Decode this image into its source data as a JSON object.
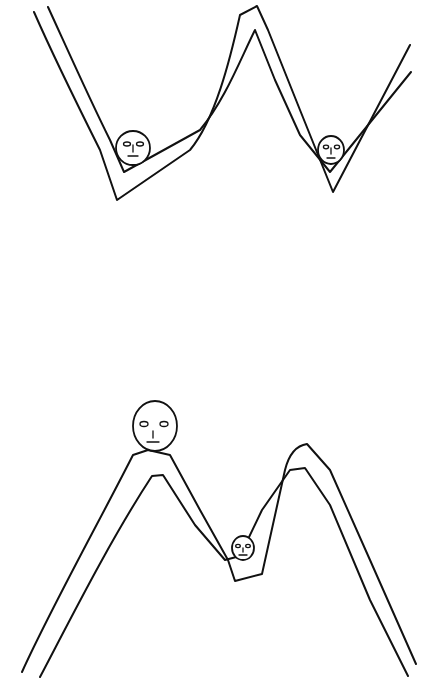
{
  "canvas": {
    "width": 421,
    "height": 682,
    "background": "#ffffff",
    "ink": "#111111"
  },
  "panels": [
    {
      "id": "w-landscape",
      "shape": "W",
      "description": "band with two valleys and one central peak",
      "faces": [
        {
          "position": "left-valley",
          "size": "medium"
        },
        {
          "position": "right-valley",
          "size": "small"
        }
      ]
    },
    {
      "id": "m-landscape",
      "shape": "M",
      "description": "band with two peaks and one central valley",
      "faces": [
        {
          "position": "left-peak",
          "size": "large"
        },
        {
          "position": "center-valley",
          "size": "small"
        }
      ]
    }
  ]
}
